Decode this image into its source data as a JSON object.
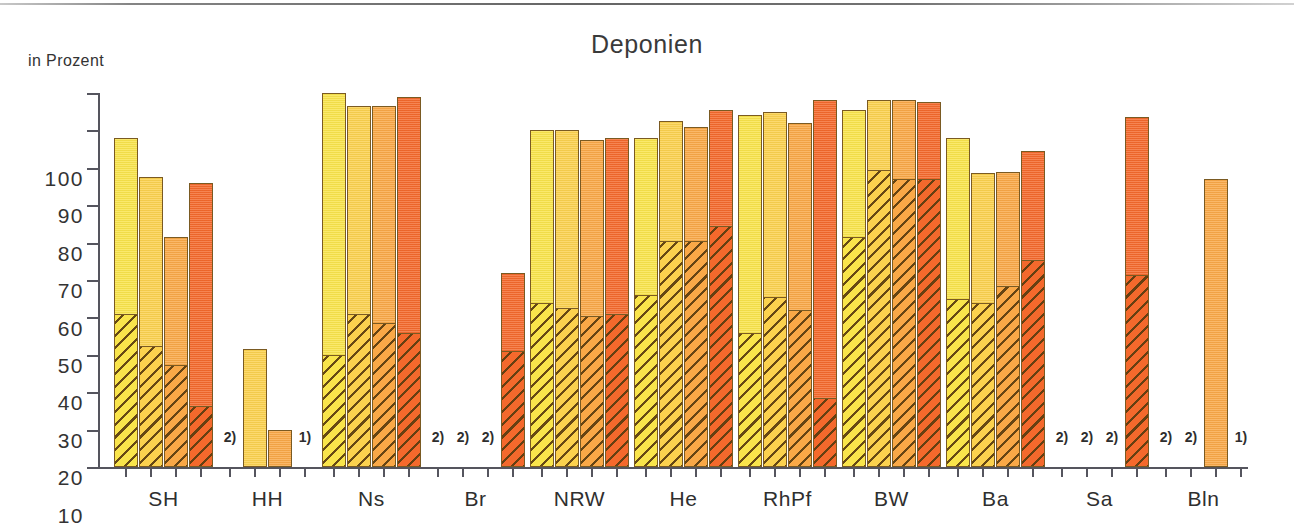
{
  "chart_data": {
    "type": "bar",
    "title": "Deponien",
    "ylabel": "in Prozent",
    "xlabel": "",
    "ylim": [
      0,
      100
    ],
    "ytick_labels": [
      "100",
      "90",
      "80",
      "70",
      "60",
      "50",
      "40",
      "30",
      "20",
      "10",
      "0"
    ],
    "ytick_values": [
      100,
      90,
      80,
      70,
      60,
      50,
      40,
      30,
      20,
      10,
      0
    ],
    "grid": false,
    "legend_position": "none",
    "categories": [
      "SH",
      "HH",
      "Ns",
      "Br",
      "NRW",
      "He",
      "RhPf",
      "BW",
      "Ba",
      "Sa",
      "Bln"
    ],
    "series": [
      {
        "name": "series-1",
        "color": "#f9e44b",
        "values": [
          88,
          null,
          100,
          null,
          90,
          88,
          94,
          95.5,
          88,
          null,
          null
        ],
        "hatched_values": [
          41,
          null,
          30,
          null,
          44,
          46,
          36,
          61.5,
          45,
          null,
          null
        ],
        "footnotes": [
          null,
          "2)",
          null,
          "2)",
          null,
          null,
          null,
          null,
          null,
          "2)",
          "2)"
        ]
      },
      {
        "name": "series-2",
        "color": "#fbd14e",
        "values": [
          77.5,
          31.5,
          96.5,
          null,
          90,
          92.5,
          95,
          98,
          78.5,
          null,
          null
        ],
        "hatched_values": [
          32.5,
          0,
          41,
          null,
          42.5,
          60.5,
          45.5,
          79.5,
          44,
          null,
          null
        ],
        "footnotes": [
          null,
          null,
          null,
          "2)",
          null,
          null,
          null,
          null,
          null,
          "2)",
          "2)"
        ]
      },
      {
        "name": "series-3",
        "color": "#f9a847",
        "values": [
          61.5,
          10,
          96.5,
          null,
          87.5,
          91,
          92,
          98,
          79,
          null,
          77
        ],
        "hatched_values": [
          27.5,
          0,
          38.5,
          null,
          40.5,
          60.5,
          42,
          77,
          48.5,
          null,
          0
        ],
        "footnotes": [
          null,
          null,
          null,
          "2)",
          null,
          null,
          null,
          null,
          null,
          "2)",
          null
        ]
      },
      {
        "name": "series-4",
        "color": "#f4692c",
        "values": [
          76,
          null,
          99,
          52,
          88,
          95.5,
          98,
          97.5,
          84.5,
          93.5,
          null
        ],
        "hatched_values": [
          16.5,
          null,
          36,
          31,
          41,
          64.5,
          18.5,
          77,
          55.5,
          51.5,
          null
        ],
        "footnotes": [
          null,
          "1)",
          null,
          null,
          null,
          null,
          null,
          null,
          null,
          null,
          "1)"
        ]
      }
    ]
  },
  "footnote_markers": {
    "not_available": "2)",
    "no_data": "1)"
  }
}
